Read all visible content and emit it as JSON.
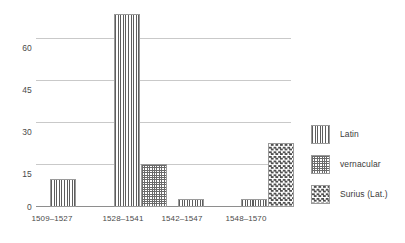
{
  "chart_data": {
    "type": "bar",
    "title": "",
    "subtitle": "",
    "xlabel": "",
    "ylabel": "",
    "ylim": [
      0,
      70
    ],
    "yticks": [
      0,
      15,
      30,
      45,
      60
    ],
    "ytick_labels": [
      "0",
      "15",
      "30",
      "45",
      "60"
    ],
    "grid": true,
    "legend_position": "right",
    "categories": [
      "1509–1527",
      "1528–1541",
      "1542–1547",
      "1548–1570"
    ],
    "series": [
      {
        "name": "Latin",
        "pattern": "vertical-stripes",
        "values": [
          10,
          69,
          3,
          3
        ]
      },
      {
        "name": "vernacular",
        "pattern": "cross-hatch",
        "values": [
          0,
          15.5,
          0,
          0
        ]
      },
      {
        "name": "Surius (Lat.)",
        "pattern": "dotted-checker",
        "values": [
          0,
          0,
          0,
          23
        ]
      }
    ],
    "colors": {
      "ink": "#5e5e5e",
      "gridline": "#c9c9c9",
      "axis": "#8e8e8e",
      "text": "#3b3b3b",
      "background": "#ffffff"
    }
  },
  "axis": {
    "y_labels": [
      "60",
      "45",
      "30",
      "15",
      "0"
    ]
  },
  "legend": {
    "items": [
      {
        "label": "Latin",
        "swatch": "vertical-stripes-swatch"
      },
      {
        "label": "vernacular",
        "swatch": "cross-hatch-swatch"
      },
      {
        "label": "Surius (Lat.)",
        "swatch": "dotted-checker-swatch"
      }
    ]
  },
  "x_labels": [
    "1509–1527",
    "1528–1541",
    "1542–1547",
    "1548–1570"
  ]
}
